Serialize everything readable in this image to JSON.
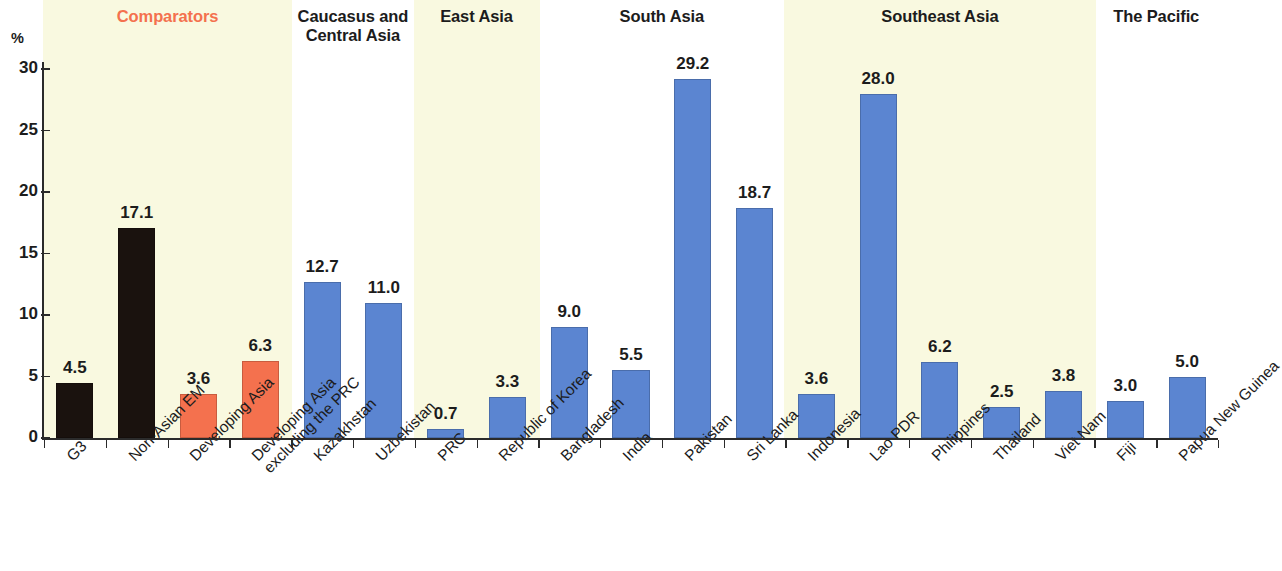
{
  "axis": {
    "y_unit": "%",
    "y_ticks": [
      "30",
      "25",
      "20",
      "15",
      "10",
      "5",
      "0"
    ]
  },
  "groups": [
    {
      "name": "comparators",
      "label": "Comparators",
      "accent": true,
      "band": true
    },
    {
      "name": "caucasus-central-asia",
      "label": "Caucasus and",
      "label2": "Central Asia",
      "accent": false,
      "band": false
    },
    {
      "name": "east-asia",
      "label": "East Asia",
      "accent": false,
      "band": true
    },
    {
      "name": "south-asia",
      "label": "South Asia",
      "accent": false,
      "band": false
    },
    {
      "name": "southeast-asia",
      "label": "Southeast Asia",
      "accent": false,
      "band": true
    },
    {
      "name": "the-pacific",
      "label": "The Pacific",
      "accent": false,
      "band": false
    }
  ],
  "colors": {
    "bar_black": "#1a120e",
    "bar_orange": "#f4714e",
    "bar_blue": "#5b85d1",
    "band": "#f9f9e0",
    "accent_text": "#f4714e",
    "axis": "#2b2b2b"
  },
  "chart_data": {
    "type": "bar",
    "title": "",
    "subtitle": "",
    "xlabel": "",
    "ylabel": "%",
    "ylim": [
      0,
      30
    ],
    "yticks": [
      0,
      5,
      10,
      15,
      20,
      25,
      30
    ],
    "grid": false,
    "legend": "none",
    "group_labels": [
      "Comparators",
      "Caucasus and Central Asia",
      "East Asia",
      "South Asia",
      "Southeast Asia",
      "The Pacific"
    ],
    "categories": [
      "G3",
      "Non-Asian EM",
      "Developing Asia",
      "Developing Asia excluding the PRC",
      "Kazakhstan",
      "Uzbekistan",
      "PRC",
      "Republic of Korea",
      "Bangladesh",
      "India",
      "Pakistan",
      "Sri Lanka",
      "Indonesia",
      "Lao PDR",
      "Philippines",
      "Thailand",
      "Viet Nam",
      "Fiji",
      "Papua New Guinea"
    ],
    "values": [
      4.5,
      17.1,
      3.6,
      6.3,
      12.7,
      11.0,
      0.7,
      3.3,
      9.0,
      5.5,
      29.2,
      18.7,
      3.6,
      28.0,
      6.2,
      2.5,
      3.8,
      3.0,
      5.0
    ],
    "value_labels": [
      "4.5",
      "17.1",
      "3.6",
      "6.3",
      "12.7",
      "11.0",
      "0.7",
      "3.3",
      "9.0",
      "5.5",
      "29.2",
      "18.7",
      "3.6",
      "28.0",
      "6.2",
      "2.5",
      "3.8",
      "3.0",
      "5.0"
    ],
    "bar_colors": [
      "#1a120e",
      "#1a120e",
      "#f4714e",
      "#f4714e",
      "#5b85d1",
      "#5b85d1",
      "#5b85d1",
      "#5b85d1",
      "#5b85d1",
      "#5b85d1",
      "#5b85d1",
      "#5b85d1",
      "#5b85d1",
      "#5b85d1",
      "#5b85d1",
      "#5b85d1",
      "#5b85d1",
      "#5b85d1",
      "#5b85d1"
    ],
    "group_of_bar": [
      0,
      0,
      0,
      0,
      1,
      1,
      2,
      2,
      3,
      3,
      3,
      3,
      4,
      4,
      4,
      4,
      4,
      5,
      5
    ],
    "category_lines": [
      [
        "G3"
      ],
      [
        "Non-Asian EM"
      ],
      [
        "Developing Asia"
      ],
      [
        "Developing Asia",
        "excluding the PRC"
      ],
      [
        "Kazakhstan"
      ],
      [
        "Uzbekistan"
      ],
      [
        "PRC"
      ],
      [
        "Republic of Korea"
      ],
      [
        "Bangladesh"
      ],
      [
        "India"
      ],
      [
        "Pakistan"
      ],
      [
        "Sri Lanka"
      ],
      [
        "Indonesia"
      ],
      [
        "Lao PDR"
      ],
      [
        "Philippines"
      ],
      [
        "Thailand"
      ],
      [
        "Viet Nam"
      ],
      [
        "Fiji"
      ],
      [
        "Papua New Guinea"
      ]
    ]
  }
}
